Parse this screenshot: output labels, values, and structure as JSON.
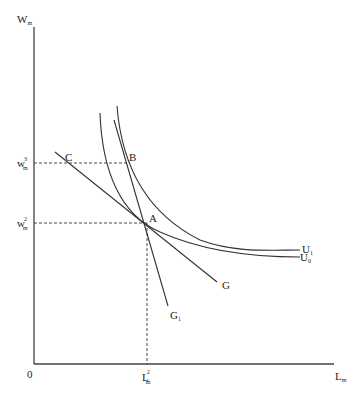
{
  "diagram": {
    "axes": {
      "y_label": "W",
      "y_label_sub": "m",
      "x_label": "L",
      "x_label_sub": "m",
      "origin_label": "0"
    },
    "y_ticks": [
      {
        "base": "w",
        "sub": "m",
        "sup": "3",
        "level": "B"
      },
      {
        "base": "w",
        "sub": "m",
        "sup": "2",
        "level": "A"
      }
    ],
    "x_ticks": [
      {
        "base": "L",
        "sub": "m",
        "sup": "2",
        "at": "A"
      }
    ],
    "points": [
      {
        "label": "A"
      },
      {
        "label": "B"
      },
      {
        "label": "C"
      }
    ],
    "curves": [
      {
        "label": "U",
        "sub": "1",
        "kind": "indifference curve"
      },
      {
        "label": "U",
        "sub": "0",
        "kind": "indifference curve"
      },
      {
        "label": "G",
        "sub": "",
        "kind": "line"
      },
      {
        "label": "G",
        "sub": "1",
        "kind": "line"
      }
    ]
  }
}
